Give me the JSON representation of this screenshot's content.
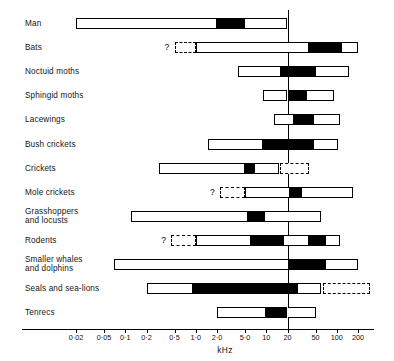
{
  "chart_data": {
    "type": "bar",
    "title": "",
    "xlabel": "kHz",
    "ylabel": "",
    "scale": "log",
    "grid": false,
    "legend": false,
    "axis": {
      "tick_labels": [
        "0·02",
        "0·05",
        "0·1",
        "0·2",
        "0·5",
        "1·0",
        "2·0",
        "5·0",
        "10",
        "20",
        "50",
        "100",
        "200"
      ],
      "tick_values": [
        0.02,
        0.05,
        0.1,
        0.2,
        0.5,
        1.0,
        2.0,
        5.0,
        10,
        20,
        50,
        100,
        200
      ],
      "xlim": [
        0.015,
        300
      ]
    },
    "reference_line": {
      "label": "20",
      "value": 20
    },
    "categories": [
      "Man",
      "Bats",
      "Noctuid moths",
      "Sphingid moths",
      "Lacewings",
      "Bush crickets",
      "Crickets",
      "Mole crickets",
      "Grasshoppers\nand locusts",
      "Rodents",
      "Smaller whales\nand dolphins",
      "Seals and sea-lions",
      "Tenrecs"
    ],
    "rows": [
      {
        "label": "Man",
        "uncertain": false,
        "range_khz": [
          0.02,
          20
        ],
        "peak_khz": [
          2.0,
          5.0
        ],
        "segments": [
          {
            "style": "white",
            "from": 0.02,
            "to": 2.0
          },
          {
            "style": "black",
            "from": 2.0,
            "to": 5.0
          },
          {
            "style": "white",
            "from": 5.0,
            "to": 20
          }
        ]
      },
      {
        "label": "Bats",
        "uncertain": true,
        "range_khz": [
          1.0,
          200
        ],
        "peak_khz": [
          40,
          120
        ],
        "segments": [
          {
            "style": "dashed",
            "from": 0.5,
            "to": 1.0
          },
          {
            "style": "white",
            "from": 1.0,
            "to": 40
          },
          {
            "style": "black",
            "from": 40,
            "to": 120
          },
          {
            "style": "white",
            "from": 120,
            "to": 200
          }
        ]
      },
      {
        "label": "Noctuid moths",
        "uncertain": false,
        "range_khz": [
          4.0,
          150
        ],
        "peak_khz": [
          16,
          50
        ],
        "segments": [
          {
            "style": "white",
            "from": 4.0,
            "to": 16
          },
          {
            "style": "black",
            "from": 16,
            "to": 50
          },
          {
            "style": "white",
            "from": 50,
            "to": 150
          }
        ]
      },
      {
        "label": "Sphingid moths",
        "uncertain": false,
        "range_khz": [
          9.0,
          90
        ],
        "peak_khz": [
          20,
          38
        ],
        "segments": [
          {
            "style": "white",
            "from": 9.0,
            "to": 20
          },
          {
            "style": "black",
            "from": 20,
            "to": 38
          },
          {
            "style": "white",
            "from": 38,
            "to": 90
          }
        ]
      },
      {
        "label": "Lacewings",
        "uncertain": false,
        "range_khz": [
          13,
          110
        ],
        "peak_khz": [
          25,
          47
        ],
        "segments": [
          {
            "style": "white",
            "from": 13,
            "to": 25
          },
          {
            "style": "black",
            "from": 25,
            "to": 47
          },
          {
            "style": "white",
            "from": 47,
            "to": 110
          }
        ]
      },
      {
        "label": "Bush crickets",
        "uncertain": false,
        "range_khz": [
          1.5,
          105
        ],
        "peak_khz": [
          9.0,
          47
        ],
        "segments": [
          {
            "style": "white",
            "from": 1.5,
            "to": 9.0
          },
          {
            "style": "black",
            "from": 9.0,
            "to": 47
          },
          {
            "style": "white",
            "from": 47,
            "to": 105
          }
        ]
      },
      {
        "label": "Crickets",
        "uncertain": true,
        "range_khz": [
          0.3,
          15
        ],
        "peak_khz": [
          5.0,
          7.0
        ],
        "segments": [
          {
            "style": "white",
            "from": 0.3,
            "to": 5.0
          },
          {
            "style": "black",
            "from": 5.0,
            "to": 7.0
          },
          {
            "style": "white",
            "from": 7.0,
            "to": 15
          },
          {
            "style": "dashed",
            "from": 15.5,
            "to": 40
          }
        ]
      },
      {
        "label": "Mole crickets",
        "uncertain": true,
        "range_khz": [
          5.0,
          170
        ],
        "peak_khz": [
          22,
          32
        ],
        "segments": [
          {
            "style": "dashed",
            "from": 2.2,
            "to": 5.0
          },
          {
            "style": "white",
            "from": 5.0,
            "to": 22
          },
          {
            "style": "black",
            "from": 22,
            "to": 32
          },
          {
            "style": "white",
            "from": 32,
            "to": 170
          }
        ]
      },
      {
        "label": "Grasshoppers\nand locusts",
        "uncertain": false,
        "range_khz": [
          0.12,
          60
        ],
        "peak_khz": [
          5.5,
          9.5
        ],
        "segments": [
          {
            "style": "white",
            "from": 0.12,
            "to": 5.5
          },
          {
            "style": "black",
            "from": 5.5,
            "to": 9.5
          },
          {
            "style": "white",
            "from": 9.5,
            "to": 60
          }
        ]
      },
      {
        "label": "Rodents",
        "uncertain": true,
        "range_khz": [
          1.0,
          110
        ],
        "peak_khz": [
          6.0,
          18
        ],
        "segments": [
          {
            "style": "dashed",
            "from": 0.45,
            "to": 1.0
          },
          {
            "style": "white",
            "from": 1.0,
            "to": 6.0
          },
          {
            "style": "black",
            "from": 6.0,
            "to": 18
          },
          {
            "style": "white",
            "from": 18,
            "to": 40
          },
          {
            "style": "black",
            "from": 40,
            "to": 70
          },
          {
            "style": "white",
            "from": 70,
            "to": 110
          }
        ]
      },
      {
        "label": "Smaller whales\nand dolphins",
        "uncertain": false,
        "range_khz": [
          0.07,
          200
        ],
        "peak_khz": [
          21,
          70
        ],
        "segments": [
          {
            "style": "white",
            "from": 0.07,
            "to": 21
          },
          {
            "style": "black",
            "from": 21,
            "to": 70
          },
          {
            "style": "white",
            "from": 70,
            "to": 200
          }
        ]
      },
      {
        "label": "Seals and sea-lions",
        "uncertain": true,
        "range_khz": [
          0.2,
          60
        ],
        "peak_khz": [
          0.9,
          28
        ],
        "segments": [
          {
            "style": "white",
            "from": 0.2,
            "to": 0.9
          },
          {
            "style": "black",
            "from": 0.9,
            "to": 28
          },
          {
            "style": "white",
            "from": 28,
            "to": 60
          },
          {
            "style": "dashed",
            "from": 64,
            "to": 300
          }
        ]
      },
      {
        "label": "Tenrecs",
        "uncertain": false,
        "range_khz": [
          2.0,
          50
        ],
        "peak_khz": [
          10,
          20
        ],
        "segments": [
          {
            "style": "white",
            "from": 2.0,
            "to": 10
          },
          {
            "style": "black",
            "from": 10,
            "to": 20
          },
          {
            "style": "white",
            "from": 20,
            "to": 50
          }
        ]
      }
    ],
    "uncertain_marker": "?"
  }
}
